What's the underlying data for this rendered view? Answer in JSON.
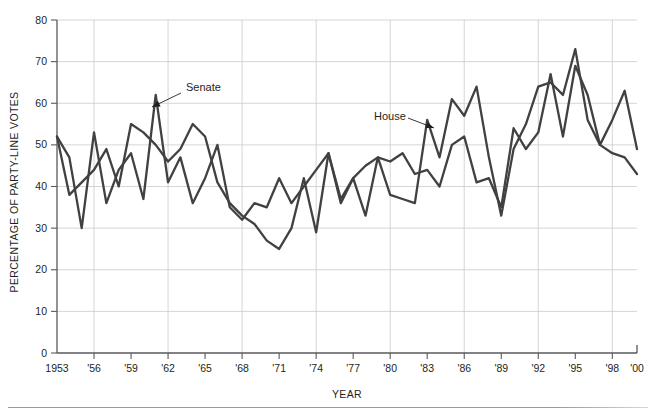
{
  "figure": {
    "background_color": "#ffffff",
    "line_color": "#414042",
    "grid_color": "#c9cacb",
    "axis_color": "#58595b"
  },
  "chart_data": {
    "type": "line",
    "title": "",
    "subtitle": "",
    "xlabel": "YEAR",
    "ylabel": "PERCENTAGE OF PARTY-LINE VOTES",
    "xlim": [
      1953,
      2000
    ],
    "ylim": [
      0,
      80
    ],
    "grid": true,
    "legend_position": "inline-annotation",
    "y_ticks": [
      0,
      10,
      20,
      30,
      40,
      50,
      60,
      70,
      80
    ],
    "y_tick_labels": [
      "0",
      "10",
      "20",
      "30",
      "40",
      "50",
      "60",
      "70",
      "80"
    ],
    "x_ticks": [
      1953,
      1956,
      1959,
      1962,
      1965,
      1968,
      1971,
      1974,
      1977,
      1980,
      1983,
      1986,
      1989,
      1992,
      1995,
      1998,
      2000
    ],
    "x_tick_labels": [
      "1953",
      "'56",
      "'59",
      "'62",
      "'65",
      "'68",
      "'71",
      "'74",
      "'77",
      "'80",
      "'83",
      "'86",
      "'89",
      "'92",
      "'95",
      "'98",
      "'00"
    ],
    "annotations": [
      {
        "label": "Senate",
        "text_x": 186,
        "text_y": 91,
        "arrow_from_x": 181,
        "arrow_from_y": 93,
        "arrow_to_x": 152,
        "arrow_to_y": 107
      },
      {
        "label": "House",
        "text_x": 374,
        "text_y": 120,
        "arrow_from_x": 408,
        "arrow_from_y": 118,
        "arrow_to_x": 434,
        "arrow_to_y": 128
      }
    ],
    "x": [
      1953,
      1954,
      1955,
      1956,
      1957,
      1958,
      1959,
      1960,
      1961,
      1962,
      1963,
      1964,
      1965,
      1966,
      1967,
      1968,
      1969,
      1970,
      1971,
      1972,
      1973,
      1974,
      1975,
      1976,
      1977,
      1978,
      1979,
      1980,
      1981,
      1982,
      1983,
      1984,
      1985,
      1986,
      1987,
      1988,
      1989,
      1990,
      1991,
      1992,
      1993,
      1994,
      1995,
      1996,
      1997,
      1998,
      1999,
      2000
    ],
    "series": [
      {
        "name": "Senate",
        "values": [
          52,
          47,
          30,
          53,
          36,
          44,
          48,
          37,
          62,
          41,
          47,
          36,
          42,
          50,
          35,
          32,
          36,
          35,
          42,
          36,
          40,
          44,
          48,
          37,
          42,
          45,
          47,
          46,
          48,
          43,
          44,
          40,
          50,
          52,
          41,
          42,
          35,
          54,
          49,
          53,
          67,
          52,
          69,
          62,
          50,
          56,
          63,
          49
        ],
        "color": "#414042"
      },
      {
        "name": "House",
        "values": [
          52,
          38,
          41,
          44,
          49,
          40,
          55,
          53,
          50,
          46,
          49,
          55,
          52,
          41,
          36,
          33,
          31,
          27,
          25,
          30,
          42,
          29,
          48,
          36,
          42,
          33,
          47,
          38,
          37,
          36,
          56,
          47,
          61,
          57,
          64,
          47,
          33,
          49,
          55,
          64,
          65,
          62,
          73,
          56,
          50,
          48,
          47,
          43
        ],
        "color": "#414042"
      }
    ]
  }
}
